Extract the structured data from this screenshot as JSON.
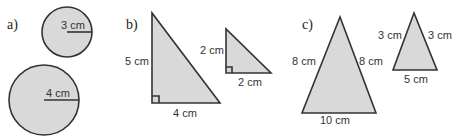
{
  "parts": {
    "a": {
      "label": "a)",
      "small_circle": {
        "radius_label": "3 cm"
      },
      "large_circle": {
        "radius_label": "4 cm"
      }
    },
    "b": {
      "label": "b)",
      "large_triangle": {
        "height_label": "5 cm",
        "base_label": "4 cm"
      },
      "small_triangle": {
        "height_label": "2 cm",
        "base_label": "2 cm"
      }
    },
    "c": {
      "label": "c)",
      "large_triangle": {
        "left_label": "8 cm",
        "right_label": "8 cm",
        "base_label": "10 cm"
      },
      "small_triangle": {
        "left_label": "3 cm",
        "right_label": "3 cm",
        "base_label": "5 cm"
      }
    }
  },
  "colors": {
    "fill": "#d9d9d9",
    "stroke": "#333333"
  }
}
